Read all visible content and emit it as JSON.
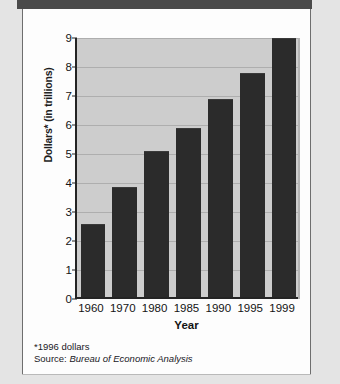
{
  "chart_data": {
    "type": "bar",
    "title": "",
    "xlabel": "Year",
    "ylabel": "Dollars* (in trillions)",
    "categories": [
      "1960",
      "1970",
      "1980",
      "1985",
      "1990",
      "1995",
      "1999"
    ],
    "values": [
      2.5,
      3.75,
      5.0,
      5.8,
      6.8,
      7.7,
      8.9
    ],
    "ylim": [
      0,
      9
    ],
    "yticks": [
      0,
      1,
      2,
      3,
      4,
      5,
      6,
      7,
      8,
      9
    ],
    "ytick_labels": [
      "0",
      "1",
      "2",
      "3",
      "4",
      "5",
      "6",
      "7",
      "8",
      "9"
    ],
    "grid": true,
    "legend": false,
    "bar_color": "#2b2b2b",
    "plot_background": "#cdcdcd",
    "gridline_color": "#aeaeae",
    "axis_color": "#242424"
  },
  "footnotes": {
    "asterisk_note": "*1996 dollars",
    "source_label": "Source:",
    "source_value": "Bureau of Economic Analysis"
  }
}
